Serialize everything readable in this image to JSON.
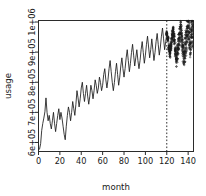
{
  "chart_data": {
    "type": "line",
    "title": "",
    "xlabel": "month",
    "ylabel": "usage",
    "xlim": [
      0,
      145
    ],
    "ylim": [
      570000,
      1005000
    ],
    "grid": false,
    "legend": null,
    "xticks": [
      0,
      20,
      40,
      60,
      80,
      100,
      120,
      140
    ],
    "xticklabels": [
      "0",
      "20",
      "40",
      "60",
      "80",
      "100",
      "120",
      "140"
    ],
    "yticks": [
      600000,
      700000,
      800000,
      900000,
      1000000
    ],
    "yticklabels": [
      "6e+05",
      "7e+05",
      "8e+05",
      "9e+05",
      "1e+06"
    ],
    "annotations": [
      {
        "name": "forecast-divider",
        "type": "vline",
        "x": 120,
        "style": "dotted"
      }
    ],
    "series": [
      {
        "name": "observed",
        "style": "solid-line",
        "x_start": 1,
        "values": [
          578000,
          596000,
          640000,
          663000,
          681000,
          702000,
          748000,
          700000,
          672000,
          690000,
          663000,
          645000,
          672000,
          700000,
          664000,
          636000,
          663000,
          690000,
          712000,
          676000,
          700000,
          681000,
          654000,
          627000,
          609000,
          654000,
          690000,
          718000,
          700000,
          672000,
          700000,
          736000,
          712000,
          690000,
          727000,
          772000,
          748000,
          718000,
          745000,
          781000,
          800000,
          763000,
          736000,
          763000,
          790000,
          754000,
          727000,
          754000,
          790000,
          772000,
          745000,
          772000,
          808000,
          790000,
          763000,
          781000,
          817000,
          799000,
          772000,
          790000,
          826000,
          845000,
          808000,
          781000,
          808000,
          845000,
          872000,
          835000,
          800000,
          772000,
          799000,
          835000,
          863000,
          826000,
          790000,
          817000,
          854000,
          881000,
          845000,
          817000,
          845000,
          881000,
          908000,
          872000,
          835000,
          863000,
          899000,
          926000,
          890000,
          854000,
          881000,
          908000,
          872000,
          845000,
          872000,
          908000,
          935000,
          899000,
          863000,
          890000,
          926000,
          953000,
          917000,
          881000,
          908000,
          944000,
          908000,
          872000,
          899000,
          935000,
          962000,
          926000,
          890000,
          917000,
          953000,
          980000,
          944000,
          908000,
          935000,
          962000
        ]
      },
      {
        "name": "forecast-simulations",
        "style": "circle-markers",
        "x_start": 120,
        "values": [
          962000,
          944000,
          917000,
          899000,
          926000,
          953000,
          971000,
          944000,
          908000,
          881000,
          908000,
          935000,
          962000,
          980000,
          953000,
          917000,
          890000,
          917000,
          944000,
          971000,
          989000,
          962000,
          935000,
          953000,
          971000
        ]
      }
    ]
  },
  "axes": {
    "xlabel": "month",
    "ylabel": "usage"
  }
}
